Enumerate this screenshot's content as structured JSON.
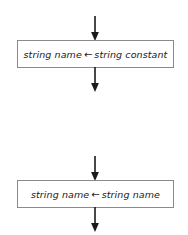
{
  "diagram": {
    "type": "flowchart",
    "background_color": "#ffffff",
    "line_color": "#1a1a1a",
    "box_border_color": "#8a8a8a",
    "box_fill_color": "#ffffff",
    "text_color": "#1a1a1a",
    "sections": [
      {
        "id": "assignment-constant",
        "incoming_arrow": "arrow-down",
        "box": {
          "target": "string name",
          "operator": "←",
          "source": "string constant",
          "full_text": "string name ← string constant"
        },
        "outgoing_arrow": "arrow-down"
      },
      {
        "id": "assignment-variable",
        "incoming_arrow": "arrow-down",
        "box": {
          "target": "string name",
          "operator": "←",
          "source": "string name",
          "full_text": "string name ← string name"
        },
        "outgoing_arrow": "arrow-down"
      }
    ]
  }
}
